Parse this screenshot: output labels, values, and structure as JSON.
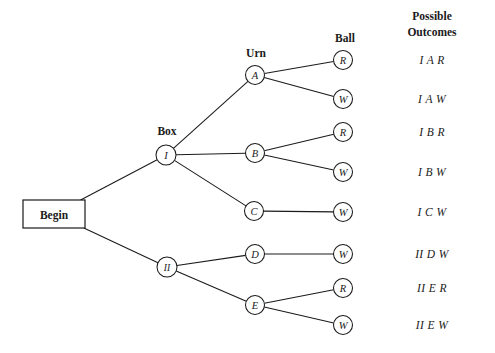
{
  "diagram": {
    "type": "probability-tree",
    "title_headers": {
      "box": "Box",
      "urn": "Urn",
      "ball": "Ball",
      "outcomes_line1": "Possible",
      "outcomes_line2": "Outcomes"
    },
    "root": {
      "label": "Begin",
      "shape": "rectangle",
      "x": 54,
      "y": 214,
      "width": 62,
      "height": 28
    },
    "nodes": [
      {
        "id": "box-I",
        "label": "I",
        "column": "box",
        "x": 166,
        "y": 155,
        "r": 10
      },
      {
        "id": "box-II",
        "label": "II",
        "column": "box",
        "x": 167,
        "y": 267,
        "r": 10
      },
      {
        "id": "urn-A",
        "label": "A",
        "column": "urn",
        "x": 255,
        "y": 75,
        "r": 9.5
      },
      {
        "id": "urn-B",
        "label": "B",
        "column": "urn",
        "x": 255,
        "y": 153,
        "r": 9.5
      },
      {
        "id": "urn-C",
        "label": "C",
        "column": "urn",
        "x": 254,
        "y": 211,
        "r": 9.5
      },
      {
        "id": "urn-D",
        "label": "D",
        "column": "urn",
        "x": 255,
        "y": 254,
        "r": 9.5
      },
      {
        "id": "urn-E",
        "label": "E",
        "column": "urn",
        "x": 255,
        "y": 305,
        "r": 9.5
      },
      {
        "id": "ball-1",
        "label": "R",
        "column": "ball",
        "x": 343,
        "y": 60,
        "r": 9.5
      },
      {
        "id": "ball-2",
        "label": "W",
        "column": "ball",
        "x": 343,
        "y": 99,
        "r": 9.5
      },
      {
        "id": "ball-3",
        "label": "R",
        "column": "ball",
        "x": 343,
        "y": 132,
        "r": 9.5
      },
      {
        "id": "ball-4",
        "label": "W",
        "column": "ball",
        "x": 343,
        "y": 172,
        "r": 9.5
      },
      {
        "id": "ball-5",
        "label": "W",
        "column": "ball",
        "x": 343,
        "y": 212,
        "r": 9.5
      },
      {
        "id": "ball-6",
        "label": "W",
        "column": "ball",
        "x": 343,
        "y": 254,
        "r": 9.5
      },
      {
        "id": "ball-7",
        "label": "R",
        "column": "ball",
        "x": 343,
        "y": 288,
        "r": 9.5
      },
      {
        "id": "ball-8",
        "label": "W",
        "column": "ball",
        "x": 343,
        "y": 325,
        "r": 9.5
      }
    ],
    "edges": [
      {
        "from": "root",
        "to": "box-I"
      },
      {
        "from": "root",
        "to": "box-II"
      },
      {
        "from": "box-I",
        "to": "urn-A"
      },
      {
        "from": "box-I",
        "to": "urn-B"
      },
      {
        "from": "box-I",
        "to": "urn-C"
      },
      {
        "from": "box-II",
        "to": "urn-D"
      },
      {
        "from": "box-II",
        "to": "urn-E"
      },
      {
        "from": "urn-A",
        "to": "ball-1"
      },
      {
        "from": "urn-A",
        "to": "ball-2"
      },
      {
        "from": "urn-B",
        "to": "ball-3"
      },
      {
        "from": "urn-B",
        "to": "ball-4"
      },
      {
        "from": "urn-C",
        "to": "ball-5"
      },
      {
        "from": "urn-D",
        "to": "ball-6"
      },
      {
        "from": "urn-E",
        "to": "ball-7"
      },
      {
        "from": "urn-E",
        "to": "ball-8"
      }
    ],
    "outcomes": [
      {
        "text": "I A R",
        "x": 432,
        "y": 60
      },
      {
        "text": "I A W",
        "x": 432,
        "y": 99
      },
      {
        "text": "I B R",
        "x": 432,
        "y": 132
      },
      {
        "text": "I B W",
        "x": 432,
        "y": 172
      },
      {
        "text": "I C W",
        "x": 432,
        "y": 212
      },
      {
        "text": "II D W",
        "x": 432,
        "y": 254
      },
      {
        "text": "II E R",
        "x": 432,
        "y": 288
      },
      {
        "text": "II E W",
        "x": 432,
        "y": 325
      }
    ],
    "header_positions": {
      "box": {
        "x": 167,
        "y": 131
      },
      "urn": {
        "x": 256,
        "y": 53
      },
      "ball": {
        "x": 345,
        "y": 38
      },
      "outcomes": {
        "x": 432,
        "y_line1": 16,
        "y_line2": 32
      }
    },
    "colors": {
      "stroke": "#1a1a1a",
      "fill": "#ffffff",
      "background": "#ffffff"
    }
  }
}
